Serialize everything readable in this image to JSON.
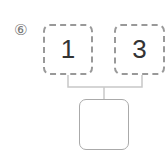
{
  "problem_label": "⑥",
  "boxes": {
    "left": "1",
    "right": "3",
    "result": ""
  },
  "colors": {
    "dashed_border": "#999999",
    "solid_border": "#aaaaaa",
    "connector": "#c8c8c8",
    "text": "#333333"
  }
}
